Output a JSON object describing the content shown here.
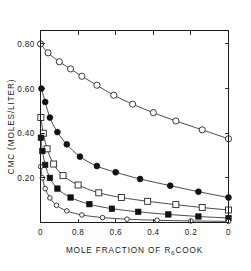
{
  "chart_data": {
    "type": "line",
    "title": "",
    "xlabel": "MOLE FRACTION OF R6COOK",
    "xlabel_prefix": "MOLE  FRACTION  OF  R",
    "xlabel_subscript": "6",
    "xlabel_suffix": "COOK",
    "ylabel": "CMC (MOLES/LITER)",
    "xlim": [
      1.0,
      0.0
    ],
    "ylim": [
      0.0,
      0.86
    ],
    "x_reversed": true,
    "grid": false,
    "legend": "none",
    "xticks": [
      1.0,
      0.8,
      0.6,
      0.4,
      0.2,
      0.0
    ],
    "xtick_labels": [
      "0",
      "0.8",
      "0.6",
      "0.4",
      "0.2",
      "0"
    ],
    "yticks": [
      0.2,
      0.4,
      0.6,
      0.8
    ],
    "ytick_labels": [
      "0.20",
      "0.40",
      "0.60",
      "0.80"
    ],
    "series": [
      {
        "name": "series-1-open-circle",
        "marker": "open-circle",
        "marker_size": 3.1,
        "x": [
          1.0,
          0.96,
          0.9,
          0.84,
          0.78,
          0.7,
          0.61,
          0.51,
          0.4,
          0.28,
          0.14,
          0.0
        ],
        "y": [
          0.8,
          0.76,
          0.72,
          0.688,
          0.655,
          0.615,
          0.57,
          0.53,
          0.492,
          0.455,
          0.415,
          0.375
        ]
      },
      {
        "name": "series-2-filled-circle",
        "marker": "filled-circle",
        "marker_size": 2.9,
        "x": [
          0.995,
          0.975,
          0.95,
          0.91,
          0.86,
          0.79,
          0.7,
          0.6,
          0.47,
          0.31,
          0.16,
          0.0
        ],
        "y": [
          0.6,
          0.54,
          0.47,
          0.405,
          0.35,
          0.295,
          0.253,
          0.225,
          0.195,
          0.165,
          0.138,
          0.112
        ]
      },
      {
        "name": "series-3-open-square",
        "marker": "open-square",
        "marker_size": 3.0,
        "x": [
          0.998,
          0.985,
          0.965,
          0.93,
          0.88,
          0.8,
          0.69,
          0.57,
          0.43,
          0.28,
          0.14,
          0.0
        ],
        "y": [
          0.47,
          0.4,
          0.33,
          0.262,
          0.21,
          0.168,
          0.133,
          0.112,
          0.095,
          0.08,
          0.067,
          0.056
        ]
      },
      {
        "name": "series-4-filled-square",
        "marker": "filled-square",
        "marker_size": 2.7,
        "x": [
          0.998,
          0.99,
          0.975,
          0.95,
          0.91,
          0.84,
          0.74,
          0.62,
          0.48,
          0.32,
          0.16,
          0.0
        ],
        "y": [
          0.38,
          0.32,
          0.258,
          0.2,
          0.152,
          0.112,
          0.082,
          0.062,
          0.048,
          0.036,
          0.027,
          0.02
        ]
      },
      {
        "name": "series-5-small-open-circle",
        "marker": "open-circle-small",
        "marker_size": 2.3,
        "x": [
          0.999,
          0.99,
          0.975,
          0.95,
          0.915,
          0.86,
          0.78,
          0.67,
          0.54,
          0.38,
          0.2,
          0.0
        ],
        "y": [
          0.25,
          0.2,
          0.152,
          0.11,
          0.077,
          0.052,
          0.034,
          0.022,
          0.015,
          0.01,
          0.007,
          0.005
        ]
      }
    ]
  },
  "colors": {
    "axis": "#1a1a1a",
    "curve": "#2b2b2b",
    "marker_fill_open": "#ffffff",
    "marker_fill_closed": "#111111",
    "background": "#ffffff"
  }
}
